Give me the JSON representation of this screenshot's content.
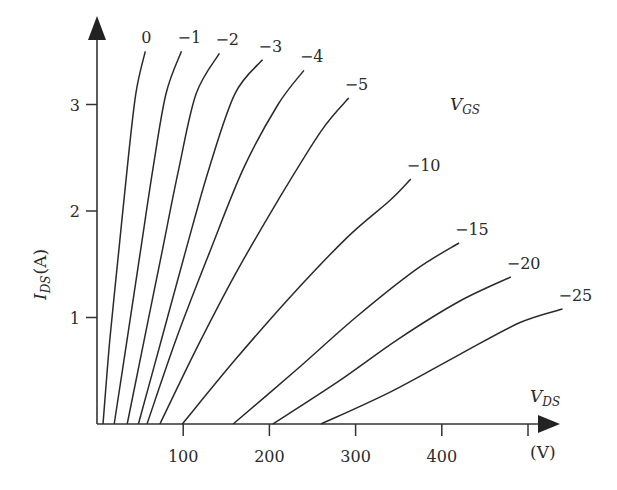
{
  "chart_data": {
    "type": "line",
    "title": "",
    "xlabel": "V_DS (V)",
    "ylabel": "I_DS (A)",
    "legend_title": "V_GS",
    "xlim": [
      0,
      500
    ],
    "ylim": [
      0,
      3.5
    ],
    "grid": false,
    "x_ticks": [
      100,
      200,
      300,
      400,
      500
    ],
    "x_tick_labels": [
      "100",
      "200",
      "300",
      "400",
      ""
    ],
    "y_ticks": [
      1,
      2,
      3
    ],
    "y_tick_labels": [
      "1",
      "2",
      "3"
    ],
    "series": [
      {
        "name": "0",
        "label": "0",
        "points": [
          [
            7,
            0
          ],
          [
            15,
            0.8
          ],
          [
            25,
            1.6
          ],
          [
            35,
            2.4
          ],
          [
            45,
            3.1
          ],
          [
            56,
            3.5
          ]
        ]
      },
      {
        "name": "-1",
        "label": "−1",
        "points": [
          [
            20,
            0
          ],
          [
            35,
            0.8
          ],
          [
            50,
            1.6
          ],
          [
            65,
            2.4
          ],
          [
            80,
            3.1
          ],
          [
            98,
            3.5
          ]
        ]
      },
      {
        "name": "-2",
        "label": "−2",
        "points": [
          [
            35,
            0
          ],
          [
            55,
            0.8
          ],
          [
            75,
            1.6
          ],
          [
            95,
            2.4
          ],
          [
            115,
            3.1
          ],
          [
            142,
            3.48
          ]
        ]
      },
      {
        "name": "-3",
        "label": "−3",
        "points": [
          [
            48,
            0
          ],
          [
            75,
            0.8
          ],
          [
            102,
            1.6
          ],
          [
            130,
            2.4
          ],
          [
            160,
            3.1
          ],
          [
            192,
            3.42
          ]
        ]
      },
      {
        "name": "-4",
        "label": "−4",
        "points": [
          [
            58,
            0
          ],
          [
            92,
            0.8
          ],
          [
            130,
            1.6
          ],
          [
            170,
            2.4
          ],
          [
            210,
            3.0
          ],
          [
            240,
            3.32
          ]
        ]
      },
      {
        "name": "-5",
        "label": "−5",
        "points": [
          [
            73,
            0
          ],
          [
            115,
            0.7
          ],
          [
            160,
            1.4
          ],
          [
            210,
            2.1
          ],
          [
            260,
            2.75
          ],
          [
            292,
            3.06
          ]
        ]
      },
      {
        "name": "-10",
        "label": "−10",
        "points": [
          [
            99,
            0
          ],
          [
            160,
            0.6
          ],
          [
            225,
            1.2
          ],
          [
            290,
            1.75
          ],
          [
            340,
            2.1
          ],
          [
            364,
            2.3
          ]
        ]
      },
      {
        "name": "-15",
        "label": "−15",
        "points": [
          [
            158,
            0
          ],
          [
            230,
            0.5
          ],
          [
            300,
            1.0
          ],
          [
            370,
            1.45
          ],
          [
            420,
            1.7
          ]
        ]
      },
      {
        "name": "-20",
        "label": "−20",
        "points": [
          [
            204,
            0
          ],
          [
            280,
            0.4
          ],
          [
            350,
            0.8
          ],
          [
            420,
            1.15
          ],
          [
            480,
            1.38
          ]
        ]
      },
      {
        "name": "-25",
        "label": "−25",
        "points": [
          [
            260,
            0
          ],
          [
            340,
            0.3
          ],
          [
            420,
            0.65
          ],
          [
            490,
            0.95
          ],
          [
            540,
            1.08
          ]
        ]
      }
    ]
  },
  "labels": {
    "y_axis_main": "I",
    "y_axis_sub": "DS",
    "y_axis_unit": "(A)",
    "x_axis_main": "V",
    "x_axis_sub": "DS",
    "x_axis_unit": "(V)",
    "legend_main": "V",
    "legend_sub": "GS"
  }
}
